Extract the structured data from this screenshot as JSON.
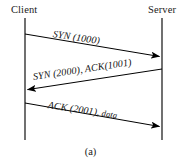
{
  "figure": {
    "caption": "(a)",
    "background_color": "#ffffff",
    "line_color": "#3a3a3a",
    "arrow_color": "#000000",
    "text_color": "#1a1a1a"
  },
  "lifelines": [
    {
      "name": "client",
      "label": "Client",
      "x": 25,
      "y_top": 18,
      "y_bottom": 140
    },
    {
      "name": "server",
      "label": "Server",
      "x": 162,
      "y_top": 18,
      "y_bottom": 140
    }
  ],
  "messages": [
    {
      "id": "syn",
      "label": "SYN (1000)",
      "tail": "",
      "from": "client",
      "to": "server",
      "direction": "right",
      "x1": 25,
      "y1": 34,
      "x2": 162,
      "y2": 57
    },
    {
      "id": "syn-ack",
      "label": "SYN (2000), ACK(1001)",
      "tail": "",
      "from": "server",
      "to": "client",
      "direction": "left",
      "x1": 162,
      "y1": 69,
      "x2": 25,
      "y2": 90
    },
    {
      "id": "ack-data",
      "label": "ACK (2001),",
      "tail": " data",
      "from": "client",
      "to": "server",
      "direction": "right",
      "x1": 25,
      "y1": 103,
      "x2": 162,
      "y2": 127
    }
  ]
}
